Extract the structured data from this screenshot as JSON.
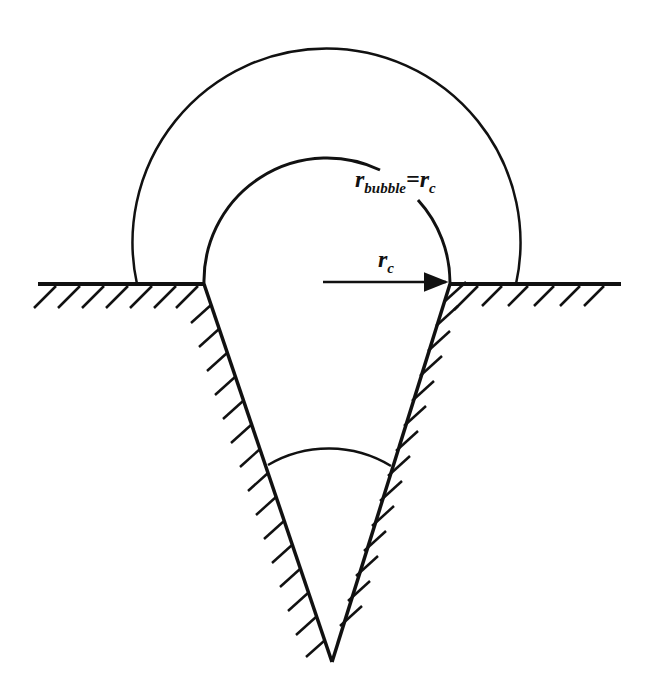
{
  "diagram": {
    "title": "",
    "labels": {
      "r_bubble_main": "r",
      "r_bubble_sub": "bubble",
      "equals": "=",
      "r_c_main": "r",
      "r_c_sub": "c",
      "radius_main": "r",
      "radius_sub": "c"
    },
    "elements": [
      {
        "id": "surface",
        "type": "hatched-surface-line"
      },
      {
        "id": "cavity",
        "type": "v-shaped-cone-cavity"
      },
      {
        "id": "inner-bubble",
        "type": "arc",
        "note": "bubble with radius r_c at cavity mouth"
      },
      {
        "id": "outer-bubble",
        "type": "arc",
        "note": "larger grown bubble"
      },
      {
        "id": "radius-arrow",
        "type": "arrow",
        "label": "r_c"
      },
      {
        "id": "cone-angle-arc",
        "type": "arc",
        "note": "cone angle marker"
      }
    ],
    "colors": {
      "stroke": "#111111",
      "background": "#ffffff"
    }
  }
}
